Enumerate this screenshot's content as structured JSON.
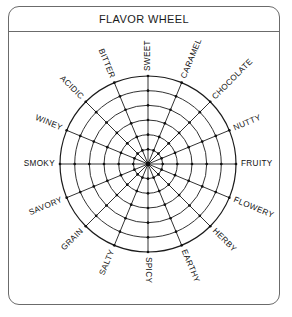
{
  "frame": {
    "title": "FLAVOR WHEEL",
    "border_color": "#6b6b6b",
    "background_color": "#ffffff"
  },
  "chart_data": {
    "type": "radar",
    "title": "FLAVOR WHEEL",
    "xlabel": "",
    "ylabel": "",
    "grid": true,
    "legend": "none",
    "rings": 6,
    "spokes": 16,
    "center": {
      "x": 148,
      "y": 164
    },
    "outer_radius": 88,
    "ring_radii": [
      14.7,
      29.3,
      44.0,
      58.7,
      73.3,
      88.0
    ],
    "start_angle_deg": -90,
    "direction": "clockwise",
    "categories": [
      "SWEET",
      "CARAMEL",
      "CHOCOLATE",
      "NUTTY",
      "FRUITY",
      "FLOWERY",
      "HERBY",
      "EARTHY",
      "SPICY",
      "SALTY",
      "GRAIN",
      "SAVORY",
      "SMOKY",
      "WINEY",
      "ACIDIC",
      "BITTER"
    ],
    "values": [
      6,
      6,
      6,
      6,
      6,
      6,
      6,
      6,
      6,
      6,
      6,
      6,
      6,
      6,
      6,
      6
    ],
    "ylim": [
      0,
      6
    ],
    "tick_labels": [],
    "marker": "filled-dot",
    "line_color": "#1b1b1b",
    "marker_color": "#101010"
  }
}
